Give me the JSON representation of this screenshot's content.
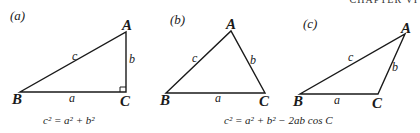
{
  "header": {
    "cropped_text": "CHAPTER VI"
  },
  "figures": [
    {
      "id": "a",
      "label": "(a)",
      "vertices": {
        "A": "A",
        "B": "B",
        "C": "C"
      },
      "sides": {
        "a": "a",
        "b": "b",
        "c": "c"
      },
      "right_angle_at": "C",
      "equation": "c² = a² + b²"
    },
    {
      "id": "b",
      "label": "(b)",
      "vertices": {
        "A": "A",
        "B": "B",
        "C": "C"
      },
      "sides": {
        "a": "a",
        "b": "b",
        "c": "c"
      }
    },
    {
      "id": "c",
      "label": "(c)",
      "vertices": {
        "A": "A",
        "B": "B",
        "C": "C"
      },
      "sides": {
        "a": "a",
        "b": "b",
        "c": "c"
      }
    }
  ],
  "shared_equation": "c² = a² + b² − 2ab cos C",
  "colors": {
    "ink": "#1a1a1a",
    "background": "#ffffff"
  }
}
